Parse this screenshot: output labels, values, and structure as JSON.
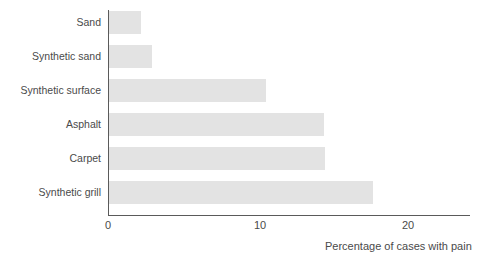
{
  "chart_data": {
    "type": "bar",
    "orientation": "horizontal",
    "title": "",
    "xlabel": "Percentage of cases with pain",
    "ylabel": "",
    "categories": [
      "Sand",
      "Synthetic sand",
      "Synthetic surface",
      "Asphalt",
      "Carpet",
      "Synthetic grill"
    ],
    "values": [
      2.2,
      2.9,
      10.5,
      14.3,
      14.4,
      17.6
    ],
    "xlim": [
      0,
      24
    ],
    "xticks": [
      0,
      10,
      20
    ],
    "xticklabels": [
      "0",
      "10",
      "20"
    ],
    "grid": false,
    "legend": null,
    "bar_color": "#e3e3e3",
    "axis_color": "#5a5a5a",
    "text_color": "#4a4a4a",
    "background": "#ffffff"
  }
}
